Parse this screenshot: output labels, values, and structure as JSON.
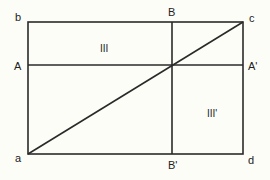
{
  "diagram": {
    "type": "geometric-rectangle-partition",
    "colors": {
      "line": "#2a2a2a",
      "text": "#222222",
      "background": "#fdfdf8"
    },
    "rectangle": {
      "x1": 28,
      "y1": 22,
      "x2": 243,
      "y2": 154
    },
    "lines": {
      "horizontal_AA": {
        "y": 65
      },
      "vertical_BB": {
        "x": 172
      },
      "diagonal_ac": {
        "from": "a",
        "to": "c"
      }
    },
    "labels": {
      "b": "b",
      "A": "A",
      "a": "a",
      "B": "B",
      "B_prime": "B'",
      "c": "c",
      "A_prime": "A'",
      "d": "d",
      "region_III": "III",
      "region_III_prime": "III'"
    }
  }
}
